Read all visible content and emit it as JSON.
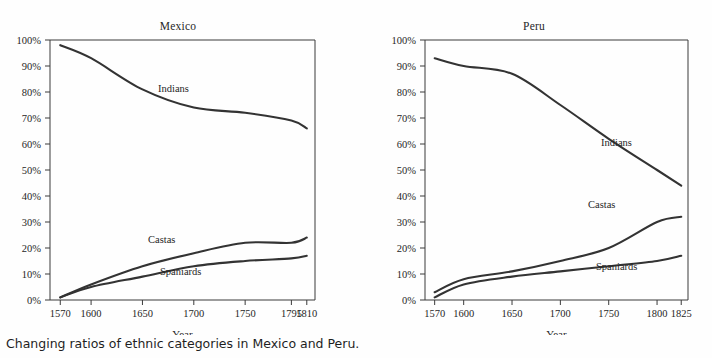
{
  "figure": {
    "caption": "Changing ratios of ethnic categories in Mexico and Peru.",
    "background_color": "#fefefe",
    "curve_color": "#333333",
    "axis_color": "#3a3a3a"
  },
  "panels": [
    {
      "key": "mexico",
      "title": "Mexico",
      "xlabel": "Year",
      "ylabel": "",
      "xticks": [
        "1570",
        "1600",
        "1650",
        "1700",
        "1750",
        "1795",
        "1810"
      ],
      "yticks": [
        "0%",
        "10%",
        "20%",
        "30%",
        "40%",
        "50%",
        "60%",
        "70%",
        "80%",
        "90%",
        "100%"
      ],
      "series_labels": [
        "Indians",
        "Castas",
        "Spaniards"
      ]
    },
    {
      "key": "peru",
      "title": "Peru",
      "xlabel": "Year",
      "ylabel": "",
      "xticks": [
        "1570",
        "1600",
        "1650",
        "1700",
        "1750",
        "1800",
        "1825"
      ],
      "yticks": [
        "0%",
        "10%",
        "20%",
        "30%",
        "40%",
        "50%",
        "60%",
        "70%",
        "80%",
        "90%",
        "100%"
      ],
      "series_labels": [
        "Indians",
        "Castas",
        "Spaniards"
      ]
    }
  ],
  "chart_data": [
    {
      "type": "line",
      "title": "Mexico",
      "xlabel": "Year",
      "ylabel": "",
      "xlim": [
        1560,
        1818
      ],
      "ylim": [
        0,
        100
      ],
      "xticks": [
        1570,
        1600,
        1650,
        1700,
        1750,
        1795,
        1810
      ],
      "yticks": [
        0,
        10,
        20,
        30,
        40,
        50,
        60,
        70,
        80,
        90,
        100
      ],
      "grid": false,
      "legend": "inline-annotations",
      "x": [
        1570,
        1600,
        1650,
        1700,
        1750,
        1795,
        1810
      ],
      "series": [
        {
          "name": "Indians",
          "values": [
            98,
            93,
            81,
            74,
            72,
            69,
            66
          ]
        },
        {
          "name": "Castas",
          "values": [
            1,
            6,
            13,
            18,
            22,
            22,
            24
          ]
        },
        {
          "name": "Spaniards",
          "values": [
            1,
            5,
            9,
            13,
            15,
            16,
            17
          ]
        }
      ]
    },
    {
      "type": "line",
      "title": "Peru",
      "xlabel": "Year",
      "ylabel": "",
      "xlim": [
        1560,
        1832
      ],
      "ylim": [
        0,
        100
      ],
      "xticks": [
        1570,
        1600,
        1650,
        1700,
        1750,
        1800,
        1825
      ],
      "yticks": [
        0,
        10,
        20,
        30,
        40,
        50,
        60,
        70,
        80,
        90,
        100
      ],
      "grid": false,
      "legend": "inline-annotations",
      "x": [
        1570,
        1600,
        1650,
        1700,
        1750,
        1800,
        1825
      ],
      "series": [
        {
          "name": "Indians",
          "values": [
            93,
            90,
            87,
            75,
            62,
            50,
            44
          ]
        },
        {
          "name": "Castas",
          "values": [
            3,
            8,
            11,
            15,
            20,
            30,
            32
          ]
        },
        {
          "name": "Spaniards",
          "values": [
            1,
            6,
            9,
            11,
            13,
            15,
            17
          ]
        }
      ]
    }
  ]
}
